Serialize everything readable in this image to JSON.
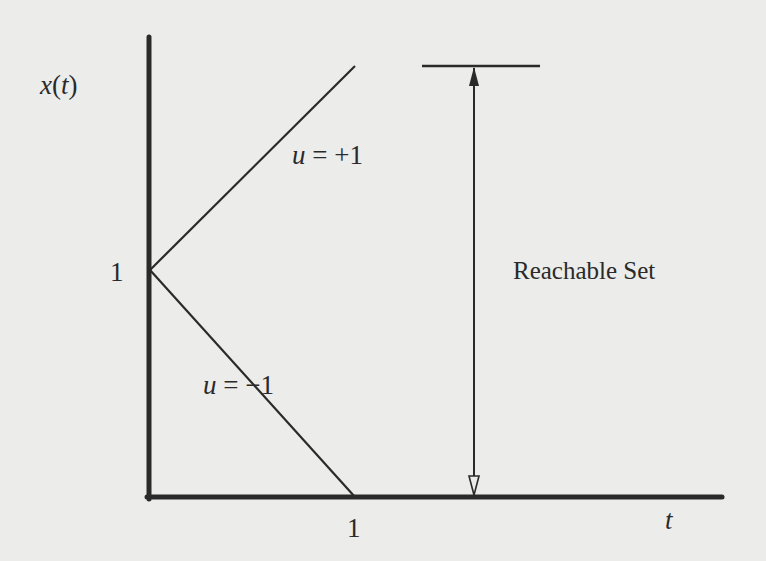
{
  "figure": {
    "type": "reachable-set-diagram",
    "y_axis_label": {
      "var": "x",
      "arg": "t"
    },
    "x_axis_label": "t",
    "y_tick": "1",
    "x_tick": "1",
    "lines": [
      {
        "label_var": "u",
        "label_eq": " = +1",
        "from": [
          0,
          1
        ],
        "to": [
          1,
          2
        ]
      },
      {
        "label_var": "u",
        "label_eq": " = −1",
        "from": [
          0,
          1
        ],
        "to": [
          1,
          0
        ]
      }
    ],
    "annotation": "Reachable Set",
    "colors": {
      "background": "#ececea",
      "ink": "#2a2a2a"
    }
  }
}
